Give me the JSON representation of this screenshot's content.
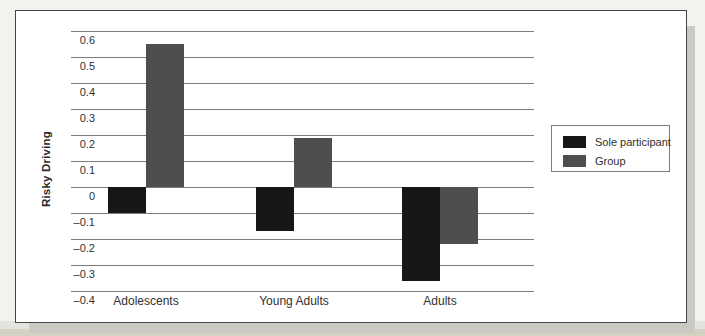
{
  "chart_data": {
    "type": "bar",
    "title": "",
    "xlabel": "",
    "ylabel": "Risky Driving",
    "categories": [
      "Adolescents",
      "Young Adults",
      "Adults"
    ],
    "series": [
      {
        "name": "Sole participant",
        "color": "#161616",
        "values": [
          -0.1,
          -0.17,
          -0.36
        ]
      },
      {
        "name": "Group",
        "color": "#4e4e4e",
        "values": [
          0.55,
          0.19,
          -0.22
        ]
      }
    ],
    "ylim": [
      -0.4,
      0.6
    ],
    "yticks": [
      0.6,
      0.5,
      0.4,
      0.3,
      0.2,
      0.1,
      0,
      -0.1,
      -0.2,
      -0.3,
      -0.4
    ],
    "ytick_labels": [
      "0.6",
      "0.5",
      "0.4",
      "0.3",
      "0.2",
      "0.1",
      "0",
      "–0.1",
      "–0.2",
      "–0.3",
      "–0.4"
    ],
    "grid": true,
    "grid_color": "#7d7d7d",
    "legend_position": "right",
    "baseline": 0
  }
}
